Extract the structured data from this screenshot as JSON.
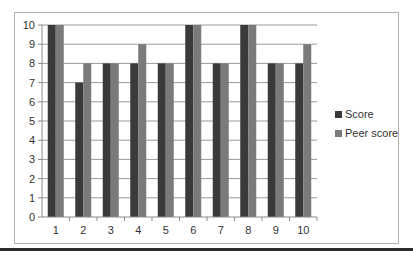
{
  "chart_data": {
    "type": "bar",
    "title": "",
    "xlabel": "",
    "ylabel": "",
    "categories": [
      "1",
      "2",
      "3",
      "4",
      "5",
      "6",
      "7",
      "8",
      "9",
      "10"
    ],
    "series": [
      {
        "name": "Score",
        "color": "#3a3a3a",
        "values": [
          10,
          7,
          8,
          8,
          8,
          10,
          8,
          10,
          8,
          8
        ]
      },
      {
        "name": "Peer score",
        "color": "#7a7a7a",
        "values": [
          10,
          8,
          8,
          9,
          8,
          10,
          8,
          10,
          8,
          9
        ]
      }
    ],
    "ylim": [
      0,
      10
    ],
    "yticks": [
      0,
      1,
      2,
      3,
      4,
      5,
      6,
      7,
      8,
      9,
      10
    ],
    "grid": true,
    "legend_position": "right"
  }
}
